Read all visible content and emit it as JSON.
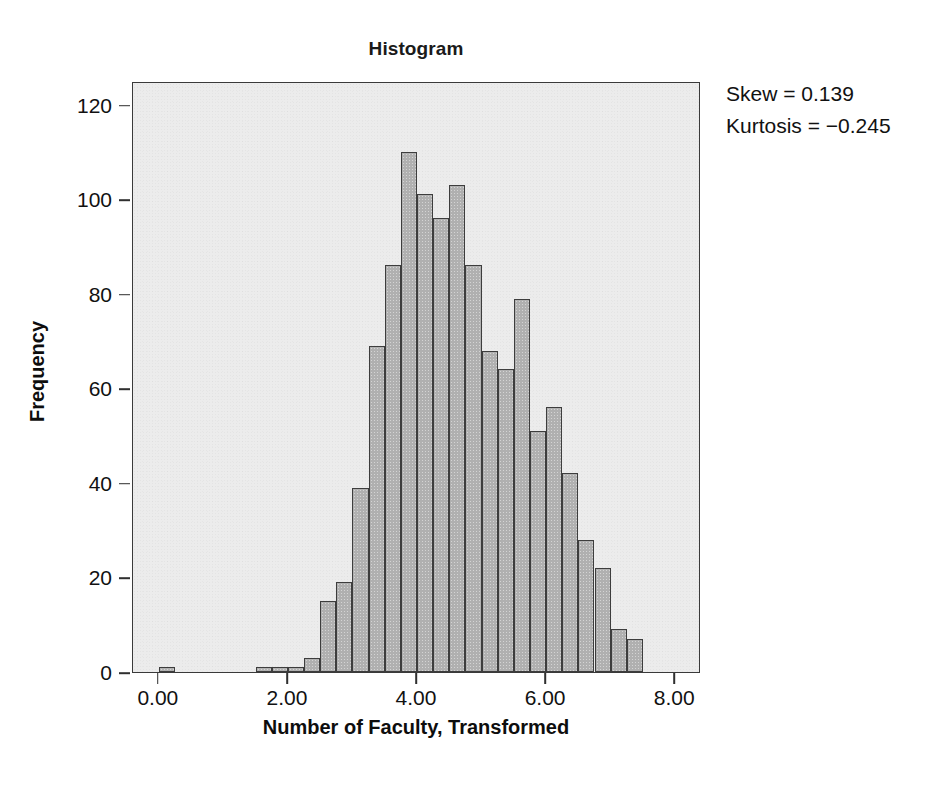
{
  "chart_data": {
    "type": "bar",
    "title": "Histogram",
    "xlabel": "Number of Faculty, Transformed",
    "ylabel": "Frequency",
    "xlim": [
      -0.4,
      8.4
    ],
    "ylim": [
      0,
      125
    ],
    "grid": false,
    "legend": null,
    "bin_width": 0.25,
    "xticks": [
      "0.00",
      "2.00",
      "4.00",
      "6.00",
      "8.00"
    ],
    "xtick_values": [
      0,
      2,
      4,
      6,
      8
    ],
    "yticks": [
      "0",
      "20",
      "40",
      "60",
      "80",
      "100",
      "120"
    ],
    "ytick_values": [
      0,
      20,
      40,
      60,
      80,
      100,
      120
    ],
    "bin_starts": [
      0.0,
      1.5,
      1.75,
      2.0,
      2.25,
      2.5,
      2.75,
      3.0,
      3.25,
      3.5,
      3.75,
      4.0,
      4.25,
      4.5,
      4.75,
      5.0,
      5.25,
      5.5,
      5.75,
      6.0,
      6.25,
      6.5,
      6.75,
      7.0,
      7.25,
      7.5
    ],
    "values": [
      1,
      1,
      1,
      1,
      3,
      15,
      19,
      39,
      69,
      86,
      110,
      101,
      96,
      103,
      86,
      68,
      64,
      79,
      51,
      56,
      42,
      28,
      22,
      9,
      7
    ],
    "bars": [
      {
        "x0": 0.0,
        "x1": 0.25,
        "value": 1
      },
      {
        "x0": 1.5,
        "x1": 1.75,
        "value": 1
      },
      {
        "x0": 1.75,
        "x1": 2.0,
        "value": 1
      },
      {
        "x0": 2.0,
        "x1": 2.25,
        "value": 1
      },
      {
        "x0": 2.25,
        "x1": 2.5,
        "value": 3
      },
      {
        "x0": 2.5,
        "x1": 2.75,
        "value": 15
      },
      {
        "x0": 2.75,
        "x1": 3.0,
        "value": 19
      },
      {
        "x0": 3.0,
        "x1": 3.25,
        "value": 39
      },
      {
        "x0": 3.25,
        "x1": 3.5,
        "value": 69
      },
      {
        "x0": 3.5,
        "x1": 3.75,
        "value": 86
      },
      {
        "x0": 3.75,
        "x1": 4.0,
        "value": 110
      },
      {
        "x0": 4.0,
        "x1": 4.25,
        "value": 101
      },
      {
        "x0": 4.25,
        "x1": 4.5,
        "value": 96
      },
      {
        "x0": 4.5,
        "x1": 4.75,
        "value": 103
      },
      {
        "x0": 4.75,
        "x1": 5.0,
        "value": 86
      },
      {
        "x0": 5.0,
        "x1": 5.25,
        "value": 68
      },
      {
        "x0": 5.25,
        "x1": 5.5,
        "value": 64
      },
      {
        "x0": 5.5,
        "x1": 5.75,
        "value": 79
      },
      {
        "x0": 5.75,
        "x1": 6.0,
        "value": 51
      },
      {
        "x0": 6.0,
        "x1": 6.25,
        "value": 56
      },
      {
        "x0": 6.25,
        "x1": 6.5,
        "value": 42
      },
      {
        "x0": 6.5,
        "x1": 6.75,
        "value": 28
      },
      {
        "x0": 6.75,
        "x1": 7.0,
        "value": 22
      },
      {
        "x0": 7.0,
        "x1": 7.25,
        "value": 9
      },
      {
        "x0": 7.25,
        "x1": 7.5,
        "value": 7
      }
    ],
    "annotations": [
      "Skew = 0.139",
      "Kurtosis = −0.245"
    ],
    "colors": {
      "bar_fill": "#b0b0b0",
      "bar_edge": "#3d3d3d",
      "plot_background": "#ececec",
      "frame": "#3a3a3a",
      "text": "#111111",
      "page_background": "#ffffff"
    }
  }
}
